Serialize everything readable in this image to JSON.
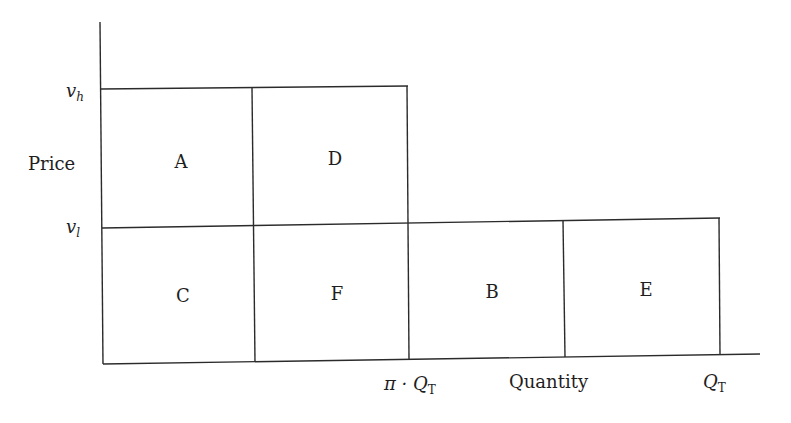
{
  "diagram": {
    "type": "price-quantity block diagram",
    "y_axis": {
      "label": "Price",
      "ticks": [
        {
          "id": "vh",
          "base": "v",
          "sub": "h"
        },
        {
          "id": "vl",
          "base": "v",
          "sub": "l"
        }
      ]
    },
    "x_axis": {
      "label": "Quantity",
      "ticks": [
        {
          "id": "pi-qt",
          "prefix": "π · ",
          "base": "Q",
          "sub": "T"
        },
        {
          "id": "qt",
          "prefix": "",
          "base": "Q",
          "sub": "T"
        }
      ]
    },
    "regions": [
      {
        "label": "A",
        "row": "upper",
        "col": 1
      },
      {
        "label": "D",
        "row": "upper",
        "col": 2
      },
      {
        "label": "C",
        "row": "lower",
        "col": 1
      },
      {
        "label": "F",
        "row": "lower",
        "col": 2
      },
      {
        "label": "B",
        "row": "lower",
        "col": 3
      },
      {
        "label": "E",
        "row": "lower",
        "col": 4
      }
    ],
    "colors": {
      "line": "#2b2b2b",
      "text": "#1e1e1e",
      "background": "#ffffff"
    }
  }
}
